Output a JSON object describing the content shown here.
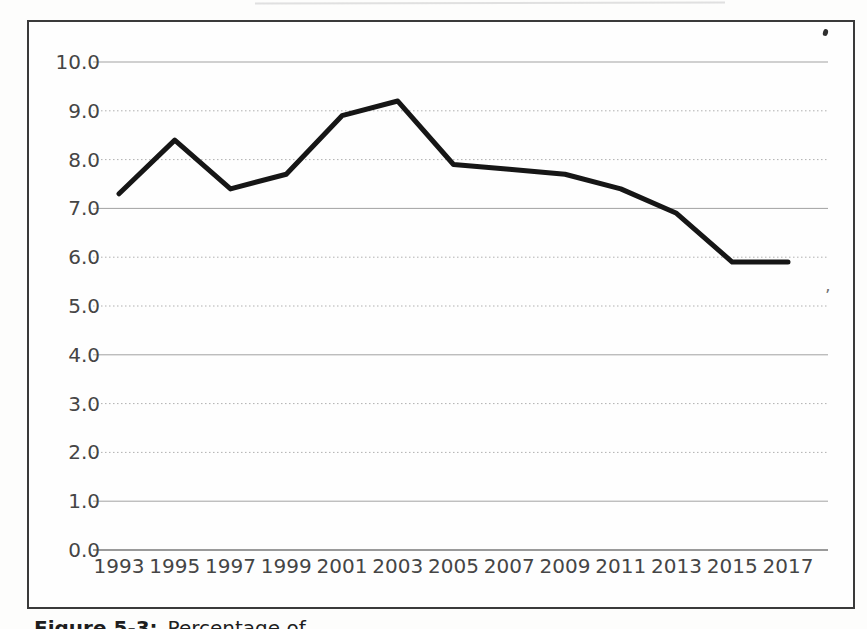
{
  "figure": {
    "caption_prefix": "Figure 5-3:",
    "caption_text": "Percentage of ..."
  },
  "artifacts": {
    "apostrophe_mark": "’"
  },
  "colors": {
    "line": "#161616",
    "grid_dotted": "#b0b0b0",
    "grid_solid": "#a2a2a2",
    "axis": "#787878",
    "frame_border": "#3a3a3a",
    "label_text": "#454545",
    "page_background": "#fdfdfc"
  },
  "chart_data": {
    "type": "line",
    "x": [
      1993,
      1995,
      1997,
      1999,
      2001,
      2003,
      2005,
      2007,
      2009,
      2011,
      2013,
      2015,
      2017
    ],
    "values": [
      7.3,
      8.4,
      7.4,
      7.7,
      8.9,
      9.2,
      7.9,
      7.8,
      7.7,
      7.4,
      6.9,
      5.9,
      5.9
    ],
    "title": "",
    "xlabel": "",
    "ylabel": "",
    "ylim": [
      0,
      10
    ],
    "ytick_step": 1,
    "ytick_labels": [
      "0.0",
      "1.0",
      "2.0",
      "3.0",
      "4.0",
      "5.0",
      "6.0",
      "7.0",
      "8.0",
      "9.0",
      "10.0"
    ],
    "grid": "horizontal",
    "legend": "none"
  }
}
